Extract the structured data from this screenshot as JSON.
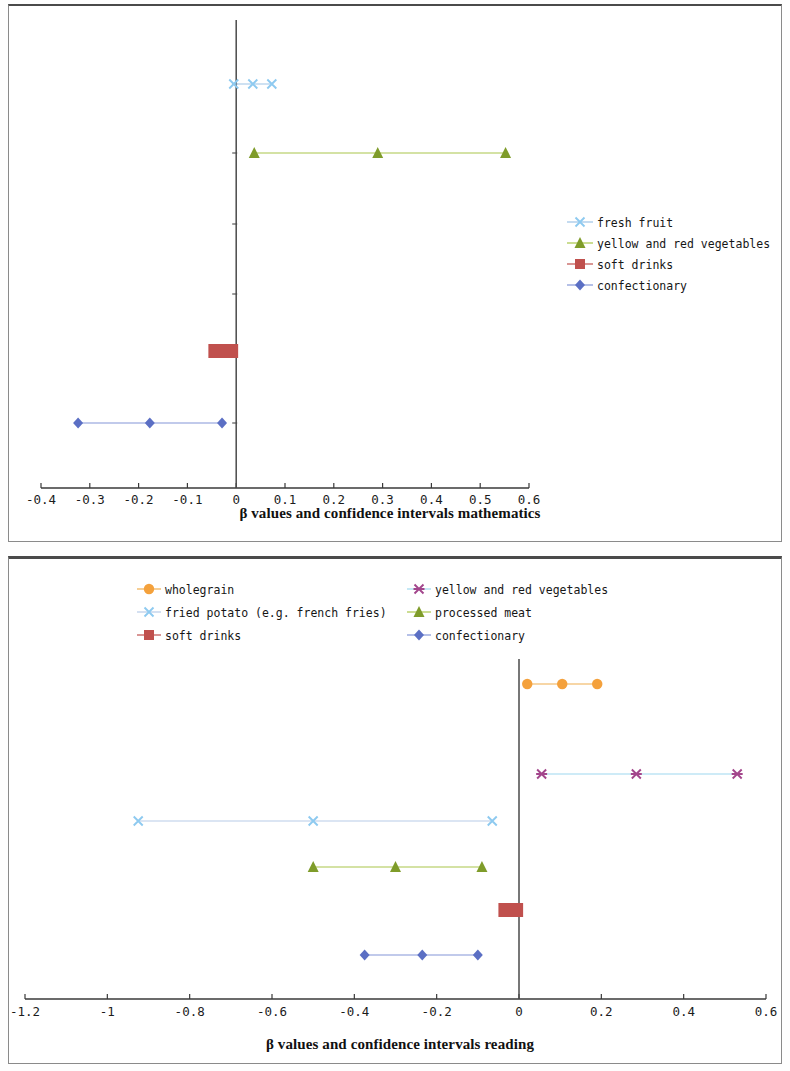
{
  "page": {
    "background": "#ffffff",
    "panels": [
      "mathematics-chart",
      "reading-chart"
    ]
  },
  "chart_data": [
    {
      "id": "mathematics",
      "type": "scatter",
      "subtype": "confidence-interval-forest-plot",
      "title": "",
      "xlabel": "β values and confidence intervals mathematics",
      "ylabel": "",
      "xlim": [
        -0.4,
        0.6
      ],
      "xticks": [
        "-0.4",
        "-0.3",
        "-0.2",
        "-0.1",
        "0",
        "0.1",
        "0.2",
        "0.3",
        "0.4",
        "0.5",
        "0.6"
      ],
      "xtick_values": [
        -0.4,
        -0.3,
        -0.2,
        -0.1,
        0,
        0.1,
        0.2,
        0.3,
        0.4,
        0.5,
        0.6
      ],
      "grid": false,
      "zero_reference_line": 0,
      "legend_position": "right-middle",
      "series": [
        {
          "name": "fresh fruit",
          "color": "#9dc3e6",
          "marker": "x-cross",
          "marker_color": "#8ecaf0",
          "lower": -0.005,
          "beta": 0.034,
          "upper": 0.073,
          "row": 1
        },
        {
          "name": "yellow and red vegetables",
          "color": "#a9c64a",
          "marker": "triangle",
          "marker_color": "#7f9c2a",
          "lower": 0.037,
          "beta": 0.29,
          "upper": 0.552,
          "row": 2
        },
        {
          "name": "soft drinks",
          "color": "#c0504d",
          "marker": "square",
          "marker_color": "#c0504d",
          "lower": -0.057,
          "beta": -0.027,
          "upper": 0.004,
          "row": 3
        },
        {
          "name": "confectionary",
          "color": "#8496d8",
          "marker": "diamond",
          "marker_color": "#5b6fc4",
          "lower": -0.324,
          "beta": -0.177,
          "upper": -0.029,
          "row": 4
        }
      ]
    },
    {
      "id": "reading",
      "type": "scatter",
      "subtype": "confidence-interval-forest-plot",
      "title": "",
      "xlabel": "β values and confidence intervals reading",
      "ylabel": "",
      "xlim": [
        -1.2,
        0.6
      ],
      "xticks": [
        "-1.2",
        "-1",
        "-0.8",
        "-0.6",
        "-0.4",
        "-0.2",
        "0",
        "0.2",
        "0.4",
        "0.6"
      ],
      "xtick_values": [
        -1.2,
        -1.0,
        -0.8,
        -0.6,
        -0.4,
        -0.2,
        0,
        0.2,
        0.4,
        0.6
      ],
      "grid": false,
      "zero_reference_line": 0,
      "legend_position": "top",
      "series": [
        {
          "name": "wholegrain",
          "color": "#f0ad4e",
          "marker": "circle",
          "marker_color": "#f4a13c",
          "lower": 0.02,
          "beta": 0.105,
          "upper": 0.19,
          "row": 1
        },
        {
          "name": "yellow and red vegetables",
          "color": "#9ed8ef",
          "marker": "asterisk",
          "marker_color": "#a3468c",
          "lower": 0.055,
          "beta": 0.285,
          "upper": 0.53,
          "row": 2
        },
        {
          "name": "fried potato (e.g. french fries)",
          "color": "#b7cbe8",
          "marker": "x-cross",
          "marker_color": "#8ecaf0",
          "lower": -0.925,
          "beta": -0.5,
          "upper": -0.065,
          "row": 3
        },
        {
          "name": "processed meat",
          "color": "#a9c64a",
          "marker": "triangle",
          "marker_color": "#7f9c2a",
          "lower": -0.5,
          "beta": -0.3,
          "upper": -0.09,
          "row": 4
        },
        {
          "name": "soft drinks",
          "color": "#c0504d",
          "marker": "square",
          "marker_color": "#c0504d",
          "lower": -0.05,
          "beta": -0.022,
          "upper": 0.01,
          "row": 5
        },
        {
          "name": "confectionary",
          "color": "#8496d8",
          "marker": "diamond",
          "marker_color": "#5b6fc4",
          "lower": -0.375,
          "beta": -0.235,
          "upper": -0.1,
          "row": 6
        }
      ]
    }
  ],
  "mathematics_chart": {
    "axis_title": "β values and confidence intervals mathematics",
    "legend": [
      {
        "label": "fresh fruit"
      },
      {
        "label": "yellow and red vegetables"
      },
      {
        "label": "soft drinks"
      },
      {
        "label": "confectionary"
      }
    ]
  },
  "reading_chart": {
    "axis_title": "β values and confidence intervals reading",
    "legend": [
      {
        "label": "wholegrain"
      },
      {
        "label": "yellow and red vegetables"
      },
      {
        "label": "fried potato (e.g. french fries)"
      },
      {
        "label": "processed meat"
      },
      {
        "label": "soft drinks"
      },
      {
        "label": "confectionary"
      }
    ]
  }
}
